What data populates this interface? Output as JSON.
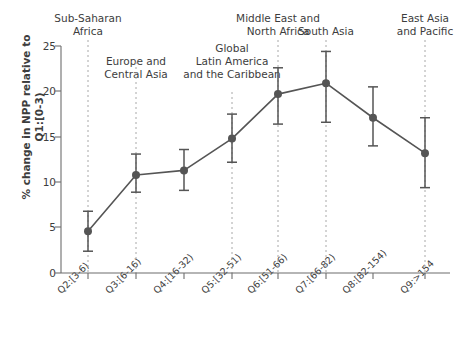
{
  "chart_data": {
    "type": "line",
    "title": "",
    "subtitle": "",
    "xlabel": "",
    "ylabel": "% change in NPP relative to Q1:[0-3)",
    "ylabel_lines": [
      "% change in NPP relative to",
      "Q1:[0-3)"
    ],
    "categories": [
      "Q2:[3-6)",
      "Q3:[6-16)",
      "Q4:[16-32)",
      "Q5:[32-51)",
      "Q6:[51-66)",
      "Q7:[66-82)",
      "Q8:[82-154)",
      "Q9:>154"
    ],
    "values": [
      4.6,
      10.8,
      11.3,
      14.8,
      19.7,
      20.9,
      17.1,
      13.2
    ],
    "error_low": [
      2.4,
      8.9,
      9.1,
      12.2,
      16.4,
      16.6,
      14.0,
      9.4
    ],
    "error_high": [
      6.8,
      13.1,
      13.6,
      17.5,
      22.6,
      24.4,
      20.5,
      17.1
    ],
    "ylim": [
      0,
      25
    ],
    "yticks": [
      0,
      5,
      10,
      15,
      20,
      25
    ],
    "ytick_labels": [
      "0",
      "5",
      "10",
      "15",
      "20",
      "25"
    ],
    "grid": false,
    "legend": "none",
    "series_color": "#555555",
    "annotation_color": "#9a9a9a",
    "annotations": [
      {
        "label_lines": [
          "Sub-Saharan",
          "Africa"
        ],
        "category": "Q2:[3-6)",
        "x": 88
      },
      {
        "label_lines": [
          "Europe and",
          "Central Asia"
        ],
        "category": "Q3:[6-16)",
        "x": 136
      },
      {
        "label_lines": [
          "Global",
          "Latin America",
          "and the Caribbean"
        ],
        "category": "Q5:[32-51)",
        "x": 232
      },
      {
        "label_lines": [
          "Middle East and",
          "North Africa"
        ],
        "category": "Q6:[51-66)",
        "x": 278
      },
      {
        "label_lines": [
          "South Asia"
        ],
        "category": "Q7:[66-82)",
        "x": 326
      },
      {
        "label_lines": [
          "East Asia",
          "and Pacific"
        ],
        "category": "Q9:>154",
        "x": 425
      }
    ]
  }
}
